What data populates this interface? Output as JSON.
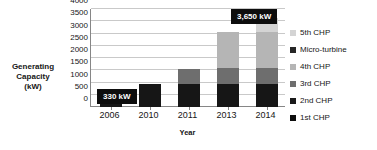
{
  "chart_data": {
    "type": "bar",
    "stacked": true,
    "title": "",
    "xlabel": "Year",
    "ylabel": "Generating Capacity (kW)",
    "ylabel_lines": [
      "Generating",
      "Capacity",
      "(kW)"
    ],
    "categories": [
      "2006",
      "2010",
      "2011",
      "2013",
      "2014"
    ],
    "ylim": [
      0,
      4000
    ],
    "yticks": [
      0,
      500,
      1000,
      1500,
      2000,
      2500,
      3000,
      3500,
      4000
    ],
    "ytick_labels": [
      "0",
      "500",
      "1000",
      "1500",
      "2000",
      "2500",
      "3000",
      "3500",
      "4000"
    ],
    "grid": true,
    "grid_axis": "y",
    "legend_position": "right",
    "series": [
      {
        "name": "1st  CHP",
        "color": "#1a1a1a",
        "values": [
          330,
          330,
          330,
          330,
          330
        ]
      },
      {
        "name": "2nd CHP",
        "color": "#1a1a1a",
        "values": [
          0,
          620,
          620,
          620,
          620
        ]
      },
      {
        "name": "3rd CHP",
        "color": "#6e6e6e",
        "values": [
          0,
          0,
          620,
          650,
          650
        ]
      },
      {
        "name": "4th CHP",
        "color": "#b5b5b5",
        "values": [
          0,
          0,
          0,
          1450,
          1450
        ]
      },
      {
        "name": "Micro-turbine",
        "color": "#262626",
        "values": [
          0,
          0,
          0,
          0,
          0
        ]
      },
      {
        "name": "5th CHP",
        "color": "#d4d4d4",
        "values": [
          0,
          0,
          0,
          0,
          600
        ]
      }
    ],
    "totals": [
      330,
      950,
      1570,
      3050,
      3650
    ],
    "annotations": [
      {
        "id": "callout-2006",
        "text": "330 kW",
        "category": "2006",
        "value": 330
      },
      {
        "id": "callout-2014",
        "text": "3,650 kW",
        "category": "2014",
        "value": 3650
      }
    ],
    "legend_entries": [
      {
        "label": "5th CHP",
        "color": "#d4d4d4"
      },
      {
        "label": "Micro-turbine",
        "color": "#262626"
      },
      {
        "label": "4th CHP",
        "color": "#b5b5b5"
      },
      {
        "label": "3rd CHP",
        "color": "#6e6e6e"
      },
      {
        "label": "2nd CHP",
        "color": "#1a1a1a"
      },
      {
        "label": "1st  CHP",
        "color": "#0d0d0d"
      }
    ],
    "bar_stacks": [
      {
        "category": "2006",
        "segments": [
          {
            "series": "1st  CHP",
            "from": 0,
            "to": 330,
            "color": "#161616"
          }
        ]
      },
      {
        "category": "2010",
        "segments": [
          {
            "series": "1st+2nd CHP",
            "from": 0,
            "to": 950,
            "color": "#161616"
          }
        ]
      },
      {
        "category": "2011",
        "segments": [
          {
            "series": "1st+2nd CHP",
            "from": 0,
            "to": 950,
            "color": "#161616"
          },
          {
            "series": "3rd CHP",
            "from": 950,
            "to": 1570,
            "color": "#6e6e6e"
          }
        ]
      },
      {
        "category": "2013",
        "segments": [
          {
            "series": "1st+2nd CHP",
            "from": 0,
            "to": 950,
            "color": "#161616"
          },
          {
            "series": "3rd CHP",
            "from": 950,
            "to": 1600,
            "color": "#6e6e6e"
          },
          {
            "series": "4th CHP",
            "from": 1600,
            "to": 3050,
            "color": "#b5b5b5"
          }
        ]
      },
      {
        "category": "2014",
        "segments": [
          {
            "series": "1st+2nd CHP",
            "from": 0,
            "to": 950,
            "color": "#161616"
          },
          {
            "series": "3rd CHP",
            "from": 950,
            "to": 1600,
            "color": "#6e6e6e"
          },
          {
            "series": "4th CHP",
            "from": 1600,
            "to": 3050,
            "color": "#b5b5b5"
          },
          {
            "series": "5th CHP",
            "from": 3050,
            "to": 3650,
            "color": "#d4d4d4"
          }
        ]
      }
    ]
  }
}
